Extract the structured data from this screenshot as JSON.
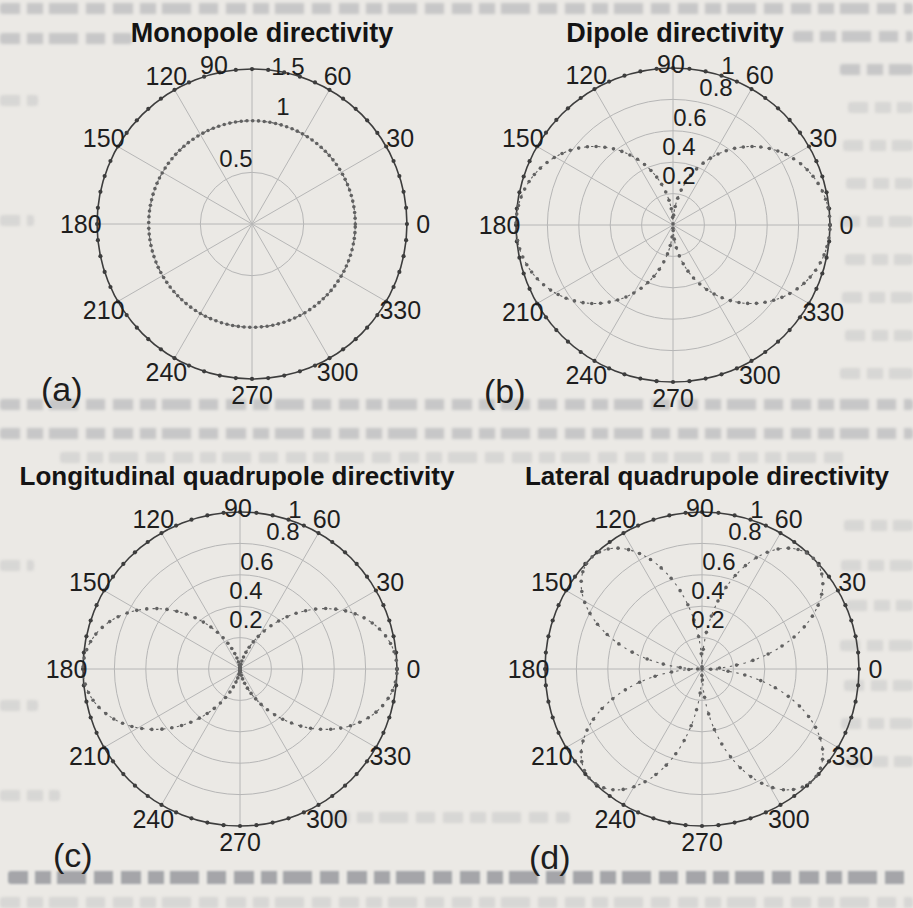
{
  "figure": {
    "description_visible_text_only": true,
    "panel_letters": [
      "(a)",
      "(b)",
      "(c)",
      "(d)"
    ]
  },
  "colors": {
    "paper": "#ebe9e5",
    "grid": "#b6b6b6",
    "axis_circle": "#3d3d3d",
    "data_curve": "#616161",
    "label_text": "#1e1e1e",
    "title_text": "#141414"
  },
  "plots": [
    {
      "id": "a",
      "title": "Monopole directivity",
      "panel_letter": "(a)",
      "angle_labels": [
        "0",
        "30",
        "60",
        "90",
        "120",
        "150",
        "180",
        "210",
        "240",
        "270",
        "300",
        "330"
      ],
      "radial_labels": [
        "0.5",
        "1",
        "1.5"
      ],
      "radial_max": "1.5"
    },
    {
      "id": "b",
      "title": "Dipole directivity",
      "panel_letter": "(b)",
      "angle_labels": [
        "0",
        "30",
        "60",
        "90",
        "120",
        "150",
        "180",
        "210",
        "240",
        "270",
        "300",
        "330"
      ],
      "radial_labels": [
        "0.2",
        "0.4",
        "0.6",
        "0.8",
        "1"
      ],
      "radial_max": "1"
    },
    {
      "id": "c",
      "title": "Longitudinal quadrupole directivity",
      "panel_letter": "(c)",
      "angle_labels": [
        "0",
        "30",
        "60",
        "90",
        "120",
        "150",
        "180",
        "210",
        "240",
        "270",
        "300",
        "330"
      ],
      "radial_labels": [
        "0.2",
        "0.4",
        "0.6",
        "0.8",
        "1"
      ],
      "radial_max": "1"
    },
    {
      "id": "d",
      "title": "Lateral quadrupole directivity",
      "panel_letter": "(d)",
      "angle_labels": [
        "0",
        "30",
        "60",
        "90",
        "120",
        "150",
        "180",
        "210",
        "240",
        "270",
        "300",
        "330"
      ],
      "radial_labels": [
        "0.2",
        "0.4",
        "0.6",
        "0.8",
        "1"
      ],
      "radial_max": "1"
    }
  ],
  "chart_data": [
    {
      "type": "polar",
      "id": "a",
      "title": "Monopole directivity",
      "pattern_key": "monopole",
      "r_formula": "r(theta) = 1 (omnidirectional)",
      "theta_deg": [
        0,
        15,
        30,
        45,
        60,
        75,
        90,
        105,
        120,
        135,
        150,
        165,
        180,
        195,
        210,
        225,
        240,
        255,
        270,
        285,
        300,
        315,
        330,
        345,
        360
      ],
      "r": [
        1,
        1,
        1,
        1,
        1,
        1,
        1,
        1,
        1,
        1,
        1,
        1,
        1,
        1,
        1,
        1,
        1,
        1,
        1,
        1,
        1,
        1,
        1,
        1,
        1
      ],
      "radial_ticks": [
        0.5,
        1.0,
        1.5
      ],
      "r_axis_max": 1.5,
      "angle_ticks_deg": [
        0,
        30,
        60,
        90,
        120,
        150,
        180,
        210,
        240,
        270,
        300,
        330
      ],
      "grid": true,
      "line_style": "dotted"
    },
    {
      "type": "polar",
      "id": "b",
      "title": "Dipole directivity",
      "pattern_key": "dipole",
      "r_formula": "r(theta) = |cos(theta)|",
      "theta_deg": [
        0,
        15,
        30,
        45,
        60,
        75,
        90,
        105,
        120,
        135,
        150,
        165,
        180,
        195,
        210,
        225,
        240,
        255,
        270,
        285,
        300,
        315,
        330,
        345,
        360
      ],
      "r": [
        1,
        0.966,
        0.866,
        0.707,
        0.5,
        0.259,
        0,
        0.259,
        0.5,
        0.707,
        0.866,
        0.966,
        1,
        0.966,
        0.866,
        0.707,
        0.5,
        0.259,
        0,
        0.259,
        0.5,
        0.707,
        0.866,
        0.966,
        1
      ],
      "radial_ticks": [
        0.2,
        0.4,
        0.6,
        0.8,
        1.0
      ],
      "r_axis_max": 1.0,
      "angle_ticks_deg": [
        0,
        30,
        60,
        90,
        120,
        150,
        180,
        210,
        240,
        270,
        300,
        330
      ],
      "grid": true,
      "line_style": "dash-dot"
    },
    {
      "type": "polar",
      "id": "c",
      "title": "Longitudinal quadrupole directivity",
      "pattern_key": "long_quad",
      "r_formula": "r(theta) = cos^2(theta)",
      "theta_deg": [
        0,
        15,
        30,
        45,
        60,
        75,
        90,
        105,
        120,
        135,
        150,
        165,
        180,
        195,
        210,
        225,
        240,
        255,
        270,
        285,
        300,
        315,
        330,
        345,
        360
      ],
      "r": [
        1,
        0.933,
        0.75,
        0.5,
        0.25,
        0.067,
        0,
        0.067,
        0.25,
        0.5,
        0.75,
        0.933,
        1,
        0.933,
        0.75,
        0.5,
        0.25,
        0.067,
        0,
        0.067,
        0.25,
        0.5,
        0.75,
        0.933,
        1
      ],
      "radial_ticks": [
        0.2,
        0.4,
        0.6,
        0.8,
        1.0
      ],
      "r_axis_max": 1.0,
      "angle_ticks_deg": [
        0,
        30,
        60,
        90,
        120,
        150,
        180,
        210,
        240,
        270,
        300,
        330
      ],
      "grid": true,
      "line_style": "dash-dot"
    },
    {
      "type": "polar",
      "id": "d",
      "title": "Lateral quadrupole directivity",
      "pattern_key": "lat_quad",
      "r_formula": "r(theta) = |sin(2 theta)|",
      "theta_deg": [
        0,
        15,
        30,
        45,
        60,
        75,
        90,
        105,
        120,
        135,
        150,
        165,
        180,
        195,
        210,
        225,
        240,
        255,
        270,
        285,
        300,
        315,
        330,
        345,
        360
      ],
      "r": [
        0,
        0.5,
        0.866,
        1,
        0.866,
        0.5,
        0,
        0.5,
        0.866,
        1,
        0.866,
        0.5,
        0,
        0.5,
        0.866,
        1,
        0.866,
        0.5,
        0,
        0.5,
        0.866,
        1,
        0.866,
        0.5,
        0
      ],
      "radial_ticks": [
        0.2,
        0.4,
        0.6,
        0.8,
        1.0
      ],
      "r_axis_max": 1.0,
      "angle_ticks_deg": [
        0,
        30,
        60,
        90,
        120,
        150,
        180,
        210,
        240,
        270,
        300,
        330
      ],
      "grid": true,
      "line_style": "dash-dot"
    }
  ]
}
